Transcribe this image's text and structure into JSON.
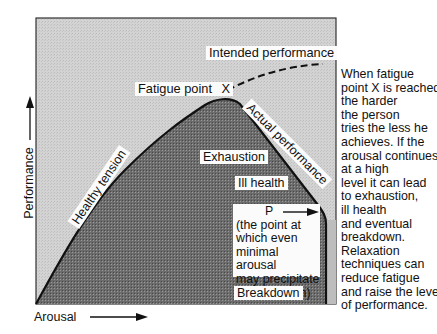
{
  "figure": {
    "labels": {
      "intended_performance": "Intended performance",
      "fatigue_point": "Fatigue point",
      "fatigue_marker": "X",
      "actual_performance": "Actual performance",
      "healthy_tension": "Healthy tension",
      "exhaustion": "Exhaustion",
      "ill_health": "Ill health",
      "p_marker": "P",
      "p_description": [
        "(the point at",
        "which even",
        "minimal arousal",
        "may precipitate",
        "a breakdown)"
      ],
      "breakdown": "Breakdown"
    },
    "axes": {
      "x_label": "Arousal",
      "y_label": "Performance"
    },
    "side_text": [
      "When fatigue",
      "point X is reached",
      "the harder",
      "the person",
      "tries the less he",
      "achieves. If the",
      "arousal continues",
      "at a high",
      "level it can lead",
      "to exhaustion,",
      "ill health",
      "and eventual",
      "breakdown.",
      "Relaxation",
      "techniques can",
      "reduce fatigue",
      "and raise the level",
      "of performance."
    ],
    "colors": {
      "background_region": "#cdcdcd",
      "under_curve_region": "#6f6f6f",
      "curve": "#111111",
      "label_bg": "#fbfbfb"
    }
  }
}
